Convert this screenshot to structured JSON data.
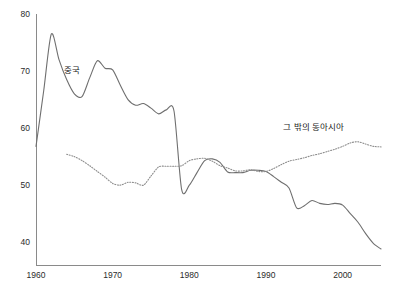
{
  "chart_data": {
    "type": "line",
    "title": "",
    "xlabel": "",
    "ylabel": "",
    "xlim": [
      1960,
      2005
    ],
    "ylim": [
      36,
      80
    ],
    "grid": false,
    "legend_position": "inline-annotations",
    "x_ticks": [
      "1960",
      "1970",
      "1980",
      "1990",
      "2000"
    ],
    "x_tick_values": [
      1960,
      1970,
      1980,
      1990,
      2000
    ],
    "y_ticks": [
      "40",
      "50",
      "60",
      "70",
      "80"
    ],
    "y_tick_values": [
      40,
      50,
      60,
      70,
      80
    ],
    "series": [
      {
        "name": "중국",
        "style": "solid",
        "color": "#6f6f6f",
        "x": [
          1960,
          1961,
          1962,
          1963,
          1964,
          1965,
          1966,
          1967,
          1968,
          1969,
          1970,
          1971,
          1972,
          1973,
          1974,
          1975,
          1976,
          1977,
          1978,
          1979,
          1980,
          1981,
          1982,
          1983,
          1984,
          1985,
          1986,
          1987,
          1988,
          1989,
          1990,
          1991,
          1992,
          1993,
          1994,
          1995,
          1996,
          1997,
          1998,
          1999,
          2000,
          2001,
          2002,
          2003,
          2004,
          2005
        ],
        "values": [
          56.8,
          66.5,
          76.5,
          72.0,
          68.5,
          66.0,
          65.5,
          68.8,
          71.8,
          70.5,
          70.2,
          67.5,
          65.0,
          64.0,
          64.3,
          63.5,
          62.5,
          63.2,
          63.0,
          49.2,
          50.0,
          52.2,
          54.3,
          54.6,
          54.0,
          52.3,
          52.2,
          52.2,
          52.6,
          52.6,
          52.4,
          51.5,
          50.5,
          49.5,
          46.0,
          46.4,
          47.3,
          46.8,
          46.6,
          46.8,
          46.5,
          45.0,
          43.5,
          41.5,
          39.8,
          38.8
        ]
      },
      {
        "name": "그 밖의 동아시아",
        "style": "dotted",
        "color": "#8d8d8d",
        "x": [
          1964,
          1965,
          1966,
          1967,
          1968,
          1969,
          1970,
          1971,
          1972,
          1973,
          1974,
          1975,
          1976,
          1977,
          1978,
          1979,
          1980,
          1981,
          1982,
          1983,
          1984,
          1985,
          1986,
          1987,
          1988,
          1989,
          1990,
          1991,
          1992,
          1993,
          1994,
          1995,
          1996,
          1997,
          1998,
          1999,
          2000,
          2001,
          2002,
          2003,
          2004,
          2005
        ],
        "values": [
          55.4,
          55.0,
          54.3,
          53.4,
          52.4,
          51.4,
          50.3,
          50.0,
          50.5,
          50.4,
          50.0,
          51.6,
          53.2,
          53.3,
          53.3,
          53.4,
          54.3,
          54.6,
          54.7,
          54.2,
          53.4,
          53.0,
          52.5,
          52.5,
          52.7,
          52.4,
          52.4,
          52.9,
          53.6,
          54.2,
          54.5,
          54.8,
          55.2,
          55.5,
          55.9,
          56.3,
          56.8,
          57.4,
          57.6,
          57.2,
          56.8,
          56.7
        ]
      }
    ],
    "annotations": [
      {
        "text": "중국",
        "x": 1963.6,
        "y": 70.4
      },
      {
        "text": "그 밖의 동아시아",
        "x": 1996.2,
        "y": 60.4
      }
    ]
  }
}
